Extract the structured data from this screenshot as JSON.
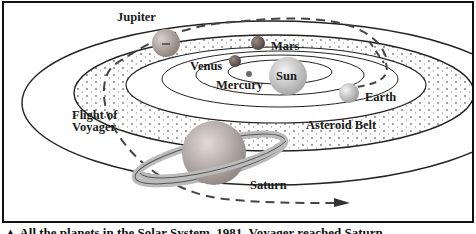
{
  "figure": {
    "labels": {
      "jupiter": "Jupiter",
      "mars": "Mars",
      "venus": "Venus",
      "sun": "Sun",
      "mercury": "Mercury",
      "earth": "Earth",
      "flight_line1": "Flight of",
      "flight_line2": "Voyager",
      "asteroid_belt": "Asteroid Belt",
      "saturn": "Saturn"
    },
    "caption": "▲ All the planets in the Solar System. 1981, Voyager reached Saturn"
  },
  "colors": {
    "frame": "#111111",
    "orbit_line": "#222222",
    "flight_path": "#444444",
    "background": "#ffffff"
  }
}
